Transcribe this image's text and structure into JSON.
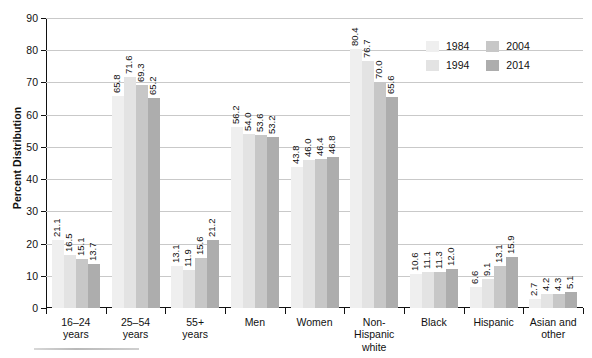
{
  "chart_data": {
    "type": "bar",
    "title": "",
    "xlabel": "",
    "ylabel": "Percent Distribution",
    "ylim": [
      0,
      90
    ],
    "yticks": [
      0,
      10,
      20,
      30,
      40,
      50,
      60,
      70,
      80,
      90
    ],
    "ytick_labels": [
      "0",
      "10",
      "20",
      "30",
      "40",
      "50",
      "60",
      "70",
      "80",
      "90"
    ],
    "grid": true,
    "legend_position": "top-right",
    "categories": [
      "16–24\nyears",
      "25–54\nyears",
      "55+\nyears",
      "Men",
      "Women",
      "Non-\nHispanic\nwhite",
      "Black",
      "Hispanic",
      "Asian and\nother"
    ],
    "series": [
      {
        "name": "1984",
        "color": "#efefef",
        "values": [
          21.1,
          65.8,
          13.1,
          56.2,
          43.8,
          80.4,
          10.6,
          6.6,
          2.7
        ],
        "labels": [
          "21.1",
          "65.8",
          "13.1",
          "56.2",
          "43.8",
          "80.4",
          "10.6",
          "6.6",
          "2.7"
        ]
      },
      {
        "name": "1994",
        "color": "#e3e3e3",
        "values": [
          16.5,
          71.6,
          11.9,
          54.0,
          46.0,
          76.7,
          11.1,
          9.1,
          4.2
        ],
        "labels": [
          "16.5",
          "71.6",
          "11.9",
          "54.0",
          "46.0",
          "76.7",
          "11.1",
          "9.1",
          "4.2"
        ]
      },
      {
        "name": "2004",
        "color": "#c7c7c7",
        "values": [
          15.1,
          69.3,
          15.6,
          53.6,
          46.4,
          70.0,
          11.3,
          13.1,
          4.3
        ],
        "labels": [
          "15.1",
          "69.3",
          "15.6",
          "53.6",
          "46.4",
          "70.0",
          "11.3",
          "13.1",
          "4.3"
        ]
      },
      {
        "name": "2014",
        "color": "#adadad",
        "values": [
          13.7,
          65.2,
          21.2,
          53.2,
          46.8,
          65.6,
          12.0,
          15.9,
          5.1
        ],
        "labels": [
          "13.7",
          "65.2",
          "21.2",
          "53.2",
          "46.8",
          "65.6",
          "12.0",
          "15.9",
          "5.1"
        ]
      }
    ]
  },
  "legend": {
    "entries": [
      {
        "label": "1984",
        "color": "#efefef"
      },
      {
        "label": "2004",
        "color": "#c7c7c7"
      },
      {
        "label": "1994",
        "color": "#e3e3e3"
      },
      {
        "label": "2014",
        "color": "#adadad"
      }
    ]
  }
}
